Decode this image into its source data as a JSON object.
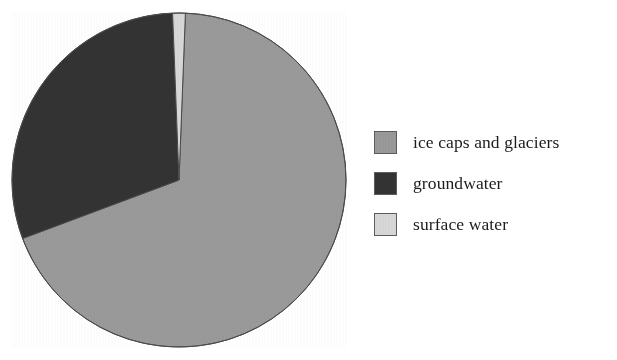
{
  "chart_data": {
    "type": "pie",
    "title": "",
    "subtitle": "",
    "xlabel": "",
    "ylabel": "",
    "grid": false,
    "legend_position": "right",
    "start_angle_deg": 0,
    "direction": "clockwise",
    "categories": [
      "ice caps and glaciers",
      "groundwater",
      "surface water"
    ],
    "values": [
      68.7,
      30.1,
      1.2
    ],
    "units": "percent",
    "colors": [
      "#9a9a9a",
      "#333333",
      "#d8d8d8"
    ],
    "slices": [
      {
        "label": "ice caps and glaciers",
        "value": 68.7,
        "color": "#9a9a9a",
        "start_angle_deg": 2.2,
        "end_angle_deg": 249.5
      },
      {
        "label": "groundwater",
        "value": 30.1,
        "color": "#333333",
        "start_angle_deg": 249.5,
        "end_angle_deg": 357.8
      },
      {
        "label": "surface water",
        "value": 1.2,
        "color": "#d8d8d8",
        "start_angle_deg": 357.8,
        "end_angle_deg": 362.2
      }
    ]
  },
  "legend": {
    "items": [
      {
        "label": "ice caps and glaciers",
        "color": "#9a9a9a",
        "swatch_name": "legend-swatch-ice-caps-and-glaciers"
      },
      {
        "label": "groundwater",
        "color": "#333333",
        "swatch_name": "legend-swatch-groundwater"
      },
      {
        "label": "surface water",
        "color": "#d8d8d8",
        "swatch_name": "legend-swatch-surface-water"
      }
    ]
  },
  "style": {
    "background": "#ffffff",
    "outline": "#4a4a4a",
    "swatch_border": "#5c5c5c",
    "text": "#1c1c1c"
  }
}
